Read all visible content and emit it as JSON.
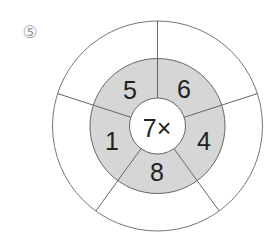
{
  "problem_number": "⑤",
  "center_label": "7×",
  "inner_ring": [
    {
      "position": "top-left",
      "value": "5"
    },
    {
      "position": "top-right",
      "value": "6"
    },
    {
      "position": "right",
      "value": "4"
    },
    {
      "position": "bottom",
      "value": "8"
    },
    {
      "position": "left",
      "value": "1"
    }
  ],
  "outer_ring": [
    {
      "position": "top-left",
      "value": ""
    },
    {
      "position": "top-right",
      "value": ""
    },
    {
      "position": "right",
      "value": ""
    },
    {
      "position": "bottom",
      "value": ""
    },
    {
      "position": "left",
      "value": ""
    }
  ],
  "colors": {
    "ring_fill": "#d6d6d6",
    "stroke": "#666666",
    "text": "#222222"
  }
}
